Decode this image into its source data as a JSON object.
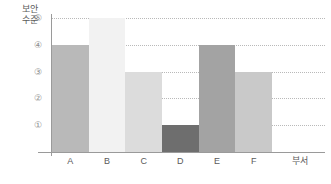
{
  "chart_data": {
    "type": "bar",
    "title": "",
    "subtitle": "",
    "xlabel": "부서",
    "ylabel": "보안\n수준",
    "categories": [
      "A",
      "B",
      "C",
      "D",
      "E",
      "F"
    ],
    "values": [
      4,
      5,
      3,
      1,
      4,
      3
    ],
    "ylim": [
      0,
      5
    ],
    "ytick_labels": [
      "⑤",
      "④",
      "③",
      "②",
      "①"
    ],
    "ytick_values": [
      5,
      4,
      3,
      2,
      1
    ],
    "grid": true,
    "grid_style": "dotted-horizontal",
    "legend": "none",
    "bar_gap": 0,
    "series": [
      {
        "name": "보안 수준",
        "values": [
          4,
          5,
          3,
          1,
          4,
          3
        ]
      }
    ],
    "bar_colors": [
      "#b9b9b9",
      "#f2f2f2",
      "#dcdcdc",
      "#6e6e6e",
      "#a3a3a3",
      "#c9c9c9"
    ],
    "axis_color": "#9a9a9a",
    "gridline_color": "#b9b9b9",
    "tick_label_color": "#8d8d8d",
    "axis_title_color": "#5a5a5a",
    "background": "#ffffff"
  }
}
